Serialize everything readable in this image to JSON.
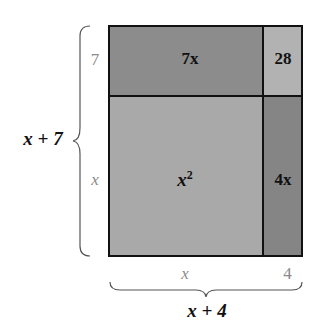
{
  "diagram": {
    "type": "area-model",
    "side_left": {
      "label": "x + 7",
      "segments": [
        "7",
        "x"
      ]
    },
    "side_bottom": {
      "label": "x + 4",
      "segments": [
        "x",
        "4"
      ]
    },
    "regions": {
      "top_left": {
        "label": "7x",
        "color": "#8c8c8c"
      },
      "top_right": {
        "label": "28",
        "color": "#b2b2b2"
      },
      "bottom_left": {
        "label_base": "x",
        "label_exp": "2",
        "color": "#a9a9a9"
      },
      "bottom_right": {
        "label": "4x",
        "color": "#858585"
      }
    },
    "border_color": "#111111"
  }
}
